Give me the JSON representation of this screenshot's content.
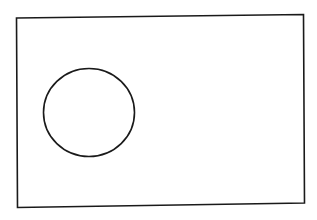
{
  "diagram": {
    "background": "#ffffff",
    "stroke_color": "#1a1a1a",
    "shapes": [
      {
        "type": "quadrilateral",
        "name": "outer-rectangle",
        "points": "16.5,18 303.5,14.5 304.5,203 17.5,207.5",
        "stroke_width": 1.6
      },
      {
        "type": "ellipse",
        "name": "circle",
        "cx": 89,
        "cy": 112.5,
        "rx": 45.5,
        "ry": 44,
        "stroke_width": 1.6
      }
    ]
  }
}
